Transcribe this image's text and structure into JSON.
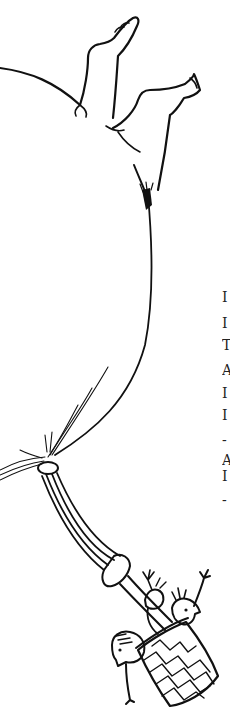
{
  "image": {
    "description": "Pen-and-ink illustration of a balloon with human legs and feet sticking out of the top, a tied knot at the bottom with a rope leading down to a woven wicker basket carrying three waving figures",
    "ink_color": "#111111",
    "background_color": "#ffffff"
  },
  "margin_text": {
    "note": "Cropped first characters of text from an adjacent page, visible at right edge",
    "fragments": [
      {
        "char": "I",
        "top": 297
      },
      {
        "char": "I",
        "top": 323
      },
      {
        "char": "T",
        "top": 345
      },
      {
        "char": "A",
        "top": 370
      },
      {
        "char": "I",
        "top": 393
      },
      {
        "char": "I",
        "top": 415
      },
      {
        "char": "-",
        "top": 440
      },
      {
        "char": "A",
        "top": 460
      },
      {
        "char": "I",
        "top": 476
      },
      {
        "char": "-",
        "top": 500
      }
    ]
  }
}
